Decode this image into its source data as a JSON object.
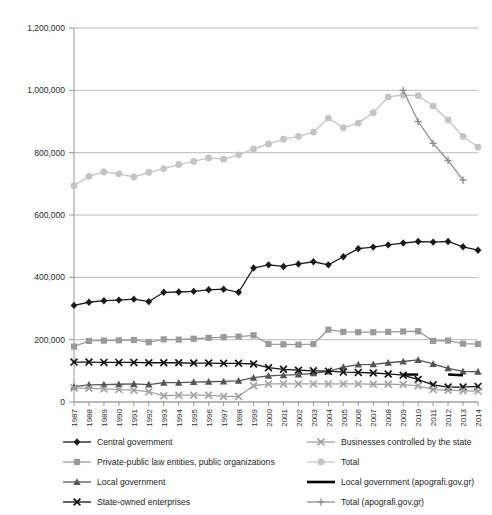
{
  "chart_data": {
    "type": "line",
    "title": "",
    "subtitle": "",
    "xlabel": "",
    "ylabel": "",
    "grid": true,
    "legend_position": "bottom",
    "ylim": [
      0,
      1200000
    ],
    "ytick_labels": [
      "0",
      "200,000",
      "400,000",
      "600,000",
      "800,000",
      "1,000,000",
      "1,200,000"
    ],
    "ytick_values": [
      0,
      200000,
      400000,
      600000,
      800000,
      1000000,
      1200000
    ],
    "categories": [
      "1987",
      "1988",
      "1989",
      "1990",
      "1991",
      "1992",
      "1993",
      "1994",
      "1995",
      "1996",
      "1997",
      "1998",
      "1999",
      "2000",
      "2001",
      "2002",
      "2003",
      "2004",
      "2005",
      "2006",
      "2007",
      "2008",
      "2009",
      "2010",
      "2011",
      "2012",
      "2013",
      "2014"
    ],
    "series": [
      {
        "name": "Central government",
        "color": "#1a1a1a",
        "marker": "diamond",
        "x": [
          "1987",
          "1988",
          "1989",
          "1990",
          "1991",
          "1992",
          "1993",
          "1994",
          "1995",
          "1996",
          "1997",
          "1998",
          "1999",
          "2000",
          "2001",
          "2002",
          "2003",
          "2004",
          "2005",
          "2006",
          "2007",
          "2008",
          "2009",
          "2010",
          "2011",
          "2012",
          "2013",
          "2014"
        ],
        "values": [
          310000,
          320000,
          325000,
          327000,
          330000,
          322000,
          352000,
          353000,
          355000,
          360000,
          362000,
          352000,
          430000,
          440000,
          435000,
          443000,
          450000,
          440000,
          466000,
          492000,
          497000,
          504000,
          510000,
          515000,
          513000,
          515000,
          498000,
          487000
        ]
      },
      {
        "name": "Private-public law entities, public organizations",
        "color": "#9a9a9a",
        "marker": "square",
        "x": [
          "1987",
          "1988",
          "1989",
          "1990",
          "1991",
          "1992",
          "1993",
          "1994",
          "1995",
          "1996",
          "1997",
          "1998",
          "1999",
          "2000",
          "2001",
          "2002",
          "2003",
          "2004",
          "2005",
          "2006",
          "2007",
          "2008",
          "2009",
          "2010",
          "2011",
          "2012",
          "2013",
          "2014"
        ],
        "values": [
          178000,
          196000,
          197000,
          198000,
          199000,
          192000,
          201000,
          200000,
          203000,
          206000,
          208000,
          210000,
          214000,
          186000,
          185000,
          184000,
          186000,
          232000,
          225000,
          224000,
          224000,
          225000,
          226000,
          227000,
          196000,
          197000,
          187000,
          186000
        ]
      },
      {
        "name": "Local government",
        "color": "#555555",
        "marker": "triangle",
        "x": [
          "1987",
          "1988",
          "1989",
          "1990",
          "1991",
          "1992",
          "1993",
          "1994",
          "1995",
          "1996",
          "1997",
          "1998",
          "1999",
          "2000",
          "2001",
          "2002",
          "2003",
          "2004",
          "2005",
          "2006",
          "2007",
          "2008",
          "2009",
          "2010",
          "2011",
          "2012",
          "2013",
          "2014"
        ],
        "values": [
          49000,
          55000,
          56000,
          57000,
          58000,
          56000,
          62000,
          62000,
          64000,
          65000,
          66000,
          68000,
          78000,
          84000,
          86000,
          88000,
          92000,
          98000,
          112000,
          120000,
          121000,
          126000,
          130000,
          135000,
          122000,
          108000,
          98000,
          97000
        ]
      },
      {
        "name": "State-owned enterprises",
        "color": "#111111",
        "marker": "x",
        "x": [
          "1987",
          "1988",
          "1989",
          "1990",
          "1991",
          "1992",
          "1993",
          "1994",
          "1995",
          "1996",
          "1997",
          "1998",
          "1999",
          "2000",
          "2001",
          "2002",
          "2003",
          "2004",
          "2005",
          "2006",
          "2007",
          "2008",
          "2009",
          "2010",
          "2011",
          "2012",
          "2013",
          "2014"
        ],
        "values": [
          128000,
          128000,
          127000,
          127000,
          127000,
          126000,
          126000,
          126000,
          125000,
          125000,
          124000,
          124000,
          122000,
          110000,
          105000,
          102000,
          100000,
          99000,
          96000,
          95000,
          93000,
          90000,
          86000,
          72000,
          55000,
          48000,
          48000,
          50000
        ]
      },
      {
        "name": "Businesses controlled by the state",
        "color": "#a2a2a2",
        "marker": "x",
        "x": [
          "1987",
          "1988",
          "1989",
          "1990",
          "1991",
          "1992",
          "1993",
          "1994",
          "1995",
          "1996",
          "1997",
          "1998",
          "1999",
          "2000",
          "2001",
          "2002",
          "2003",
          "2004",
          "2005",
          "2006",
          "2007",
          "2008",
          "2009",
          "2010",
          "2011",
          "2012",
          "2013",
          "2014"
        ],
        "values": [
          45000,
          44000,
          42000,
          40000,
          38000,
          33000,
          20000,
          22000,
          22000,
          22000,
          18000,
          18000,
          52000,
          58000,
          58000,
          58000,
          58000,
          58000,
          58000,
          58000,
          57000,
          57000,
          56000,
          52000,
          40000,
          38000,
          36000,
          35000
        ]
      },
      {
        "name": "Total",
        "color": "#c4c4c4",
        "marker": "circle",
        "x": [
          "1987",
          "1988",
          "1989",
          "1990",
          "1991",
          "1992",
          "1993",
          "1994",
          "1995",
          "1996",
          "1997",
          "1998",
          "1999",
          "2000",
          "2001",
          "2002",
          "2003",
          "2004",
          "2005",
          "2006",
          "2007",
          "2008",
          "2009",
          "2010",
          "2011",
          "2012",
          "2013",
          "2014"
        ],
        "values": [
          694000,
          724000,
          738000,
          732000,
          722000,
          737000,
          749000,
          762000,
          772000,
          783000,
          779000,
          793000,
          812000,
          828000,
          843000,
          852000,
          866000,
          911000,
          880000,
          895000,
          928000,
          979000,
          985000,
          983000,
          950000,
          905000,
          852000,
          818000
        ]
      },
      {
        "name": "Local government (apografi.gov.gr)",
        "color": "#000000",
        "marker": "none",
        "x": [
          "2009",
          "2010",
          "2012",
          "2013"
        ],
        "values": [
          88000,
          88000,
          88000,
          86000
        ],
        "segments": [
          [
            "2009",
            "2010"
          ],
          [
            "2012",
            "2013"
          ]
        ]
      },
      {
        "name": "Total (apografi.gov.gr)",
        "color": "#8f8f8f",
        "marker": "plus",
        "x": [
          "2009",
          "2010",
          "2011",
          "2012",
          "2013"
        ],
        "values": [
          1000000,
          900000,
          830000,
          775000,
          712000
        ]
      }
    ]
  },
  "legend": {
    "left_column": [
      {
        "label": "Central government",
        "key": "line-marker-diamond-dark"
      },
      {
        "label": "Private-public law entities, public organizations",
        "key": "line-marker-square-gray"
      },
      {
        "label": "Local government",
        "key": "line-marker-triangle-gray"
      },
      {
        "label": "State-owned enterprises",
        "key": "line-marker-x-dark"
      }
    ],
    "right_column": [
      {
        "label": "Businesses controlled by the state",
        "key": "line-marker-x-lightgray"
      },
      {
        "label": "Total",
        "key": "line-marker-circle-lightgray"
      },
      {
        "label": "Local government (apografi.gov.gr)",
        "key": "line-plain-black"
      },
      {
        "label": "Total (apografi.gov.gr)",
        "key": "line-marker-plus-gray"
      }
    ]
  }
}
